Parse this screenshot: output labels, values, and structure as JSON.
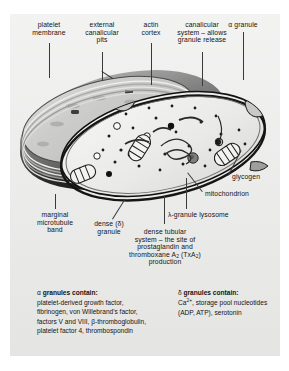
{
  "figure": {
    "panel_color": "#ececeb",
    "ink_color": "#141414"
  },
  "labels": {
    "platelet_membrane": [
      "platelet",
      "membrane"
    ],
    "external_canalicular_pits": [
      "external",
      "canalicular",
      "pits"
    ],
    "actin_cortex": [
      "actin",
      "cortex"
    ],
    "canalicular_system": [
      "canalicular",
      "system – allows",
      "granule release"
    ],
    "alpha_granule": [
      "α granule"
    ],
    "glycogen": [
      "glycogen"
    ],
    "mitochondrion": [
      "mitochondrion"
    ],
    "lambda_granule_lysosome": [
      "λ-granule lysosome"
    ],
    "marginal_microtubule_band": [
      "marginal",
      "microtubule",
      "band"
    ],
    "dense_granule": [
      "dense (δ)",
      "granule"
    ],
    "dense_tubular_system": [
      "dense tubular",
      "system – the site of",
      "prostaglandin and",
      "thromboxane A2 (TxA2)",
      "production"
    ]
  },
  "alpha_box": {
    "heading_symbol": "α",
    "heading": "granules contain:",
    "body": "platelet-derived growth factor, fibrinogen, von Willebrand's factor, factors V and VIII, β-thromboglobulin, platelet factor 4, thrombospondin"
  },
  "delta_box": {
    "heading_symbol": "δ",
    "heading": "granules contain:",
    "line1_prefix": "Ca",
    "line1_sup": "2+",
    "line1_rest": ", storage pool",
    "line2": "nucleotides (ADP, ATP),",
    "line3": "serotonin"
  },
  "diagram_parts": {
    "outer_membrane": "platelet-outer-membrane",
    "cut_face": "platelet-cut-face",
    "microtubule_band": "marginal-microtubule-band",
    "organelles": [
      "alpha-granule",
      "dense-granule",
      "mitochondrion",
      "lysosome",
      "dense-tubular-system",
      "glycogen-particle",
      "canalicular-opening"
    ]
  }
}
